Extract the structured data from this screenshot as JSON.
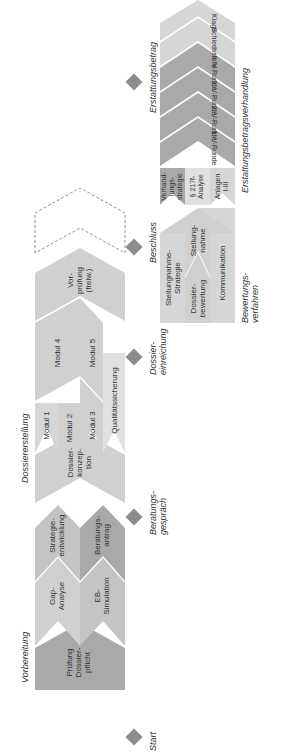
{
  "phases": {
    "vorbereitung": "Vorbereitung",
    "dossiererstellung": "Dossiererstellung",
    "bewertungsverfahren": "Bewertungs-\nverfahren",
    "erstattungsbetragsverhandlung": "Erstattungsbetragsverhandlung"
  },
  "milestones": [
    {
      "label": "Start"
    },
    {
      "label": "Beratungs-\ngespräch"
    },
    {
      "label": "Dossier-\neinreichung"
    },
    {
      "label": "Beschluss"
    },
    {
      "label": "Erstattungsbetrag"
    }
  ],
  "vorbereitung_blocks": {
    "pruefung": "Prüfung\nDossier-\npflicht",
    "gap": "Gap-\nAnalyse",
    "eb_sim": "EB-\nSimulation",
    "strategie": "Strategie-\nentwicklung",
    "beratungsantrag": "Beratungs-\nantrag"
  },
  "dossier_blocks": {
    "konzeption": "Dossier-\nkonzep-\ntion",
    "modul1": "Modul 1",
    "modul2": "Modul 2",
    "modul3": "Modul 3",
    "modul4": "Modul 4",
    "modul5": "Modul 5",
    "qualitaet": "Qualitätssicherung",
    "vorpruefung": "Vor-\nprüfung\n(freiw.)"
  },
  "bewertung_blocks": {
    "stellungnahme_strategie": "Stellungnahme-\nStrategie",
    "dossierbewertung": "Dossier-\nbewertung",
    "stellungnahme": "Stellung-\nnahme",
    "kommunikation": "Kommunikation"
  },
  "verhandlung_blocks": {
    "verhandlungsstrategie": "Verhand-\nlungs-\nstrategie",
    "analyse_217f": "§ 217f-\nAnalyse",
    "anlagen": "Anlagen\nI-III",
    "runde1": "1. V-Runde",
    "runde2": "2. V-Runde",
    "runde3": "3. V-Runde",
    "runde4": "4. V-Runde",
    "schiedsstelle": "Schiedsstelle",
    "klage": "Klage"
  },
  "colors": {
    "dark": "#a9a9a9",
    "mid": "#c4c4c4",
    "light": "#d6d6d6",
    "lighter": "#e0e0e0",
    "diamond": "#8c8c8c"
  }
}
